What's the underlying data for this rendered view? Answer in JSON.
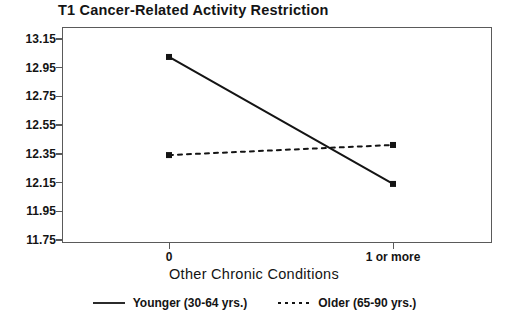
{
  "chart_data": {
    "type": "line",
    "title": "T1 Cancer-Related Activity Restriction",
    "xlabel": "Other Chronic Conditions",
    "ylabel": "",
    "categories": [
      "0",
      "1 or more"
    ],
    "ylim": [
      11.75,
      13.15
    ],
    "yticks": [
      "13.15",
      "12.95",
      "12.75",
      "12.55",
      "12.35",
      "12.15",
      "11.95",
      "11.75"
    ],
    "ytick_values": [
      13.15,
      12.95,
      12.75,
      12.55,
      12.35,
      12.15,
      11.95,
      11.75
    ],
    "grid": false,
    "legend_position": "bottom",
    "series": [
      {
        "name": "Younger (30-64 yrs.)",
        "values": [
          13.02,
          12.14
        ],
        "style": "solid",
        "color": "#141414"
      },
      {
        "name": "Older (65-90 yrs.)",
        "values": [
          12.34,
          12.41
        ],
        "style": "dotted",
        "color": "#141414"
      }
    ]
  },
  "chart": {
    "title": "T1 Cancer-Related Activity Restriction",
    "x_axis_title": "Other Chronic Conditions",
    "x_tick_0": "0",
    "x_tick_1": "1 or more",
    "y_tick_0": "13.15",
    "y_tick_1": "12.95",
    "y_tick_2": "12.75",
    "y_tick_3": "12.55",
    "y_tick_4": "12.35",
    "y_tick_5": "12.15",
    "y_tick_6": "11.95",
    "y_tick_7": "11.75"
  },
  "legend": {
    "items": [
      {
        "label": "Younger (30-64 yrs.)",
        "style": "solid-line-icon"
      },
      {
        "label": "Older (65-90 yrs.)",
        "style": "dotted-line-icon"
      }
    ]
  },
  "colors": {
    "line": "#141414",
    "frame": "#5a5a5a",
    "background": "#ffffff"
  }
}
